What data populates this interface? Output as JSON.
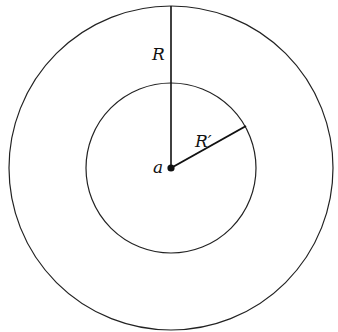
{
  "diagram": {
    "center_label": "a",
    "outer_radius_label": "R",
    "inner_radius_label": "R′",
    "outer_circle": {
      "cx": 171,
      "cy": 168,
      "r": 162
    },
    "inner_circle": {
      "cx": 171,
      "cy": 168,
      "r": 85
    },
    "colors": {
      "stroke": "#222222",
      "background": "#ffffff"
    }
  }
}
